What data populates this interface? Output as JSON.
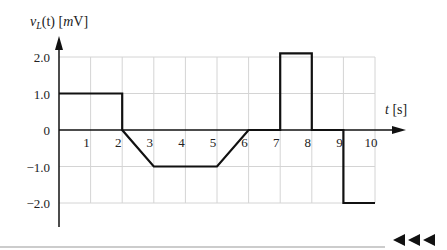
{
  "chart_data": {
    "type": "line",
    "title": "",
    "xlabel": "t [s]",
    "ylabel": "v_L(t) [mV]",
    "ylabel_parts": {
      "v": "v",
      "sub": "L",
      "rest": "(t) [",
      "m": "m",
      "unit": "V]"
    },
    "xlabel_parts": {
      "t": "t",
      "unit": " [s]"
    },
    "x_ticks": [
      "1",
      "2",
      "3",
      "4",
      "5",
      "6",
      "7",
      "8",
      "9",
      "10"
    ],
    "y_ticks": [
      "2.0",
      "1.0",
      "0",
      "−1.0",
      "−2.0"
    ],
    "xlim": [
      0,
      10
    ],
    "ylim": [
      -2.5,
      2.5
    ],
    "grid": true,
    "series": [
      {
        "name": "v_L(t)",
        "x": [
          0,
          2,
          2,
          3,
          5,
          6,
          7,
          7,
          8,
          8,
          9,
          9,
          10
        ],
        "y": [
          1.0,
          1.0,
          0,
          -1.0,
          -1.0,
          0,
          0,
          2.1,
          2.1,
          0,
          0,
          -2.0,
          -2.0
        ]
      }
    ]
  },
  "footer": {
    "nav_arrows": "◀◀◀"
  }
}
